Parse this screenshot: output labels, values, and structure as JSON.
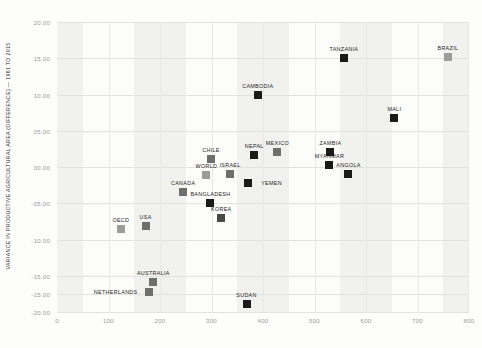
{
  "chart_data": {
    "type": "scatter",
    "title": "",
    "xlabel": "",
    "ylabel": "VARIANCE IN PRODUCTIVE AGRICULTURAL AREA (DIFFERENCE) — 1961 TO 2015",
    "xlim": [
      0,
      800
    ],
    "ylim": [
      -20,
      20
    ],
    "xticks": [
      "0",
      "100",
      "200",
      "300",
      "400",
      "500",
      "600",
      "700",
      "800"
    ],
    "xtick_values": [
      0,
      100,
      200,
      300,
      400,
      500,
      600,
      700,
      800
    ],
    "yticks": [
      "20.00",
      "15.00",
      "10.00",
      "05.00",
      "00.00",
      "-05.00",
      "-10.00",
      "-15.00",
      "-15.00",
      "-20.00"
    ],
    "ytick_values": [
      20,
      15,
      10,
      5,
      0,
      -5,
      -10,
      -15,
      -17.5,
      -20
    ],
    "grid": true,
    "legend": "none",
    "banding": "alternating vertical gray bands",
    "points": [
      {
        "label": "TANZANIA",
        "x": 557,
        "y": 15.0,
        "color": "#1a1a1a",
        "label_dx": 0,
        "label_dy": -9
      },
      {
        "label": "BRAZIL",
        "x": 759,
        "y": 15.2,
        "color": "#9c9c9a",
        "label_dx": 0,
        "label_dy": -9
      },
      {
        "label": "CAMBODIA",
        "x": 390,
        "y": 10.0,
        "color": "#1a1a1a",
        "label_dx": 0,
        "label_dy": -9
      },
      {
        "label": "MALI",
        "x": 655,
        "y": 6.7,
        "color": "#1a1a1a",
        "label_dx": 0,
        "label_dy": -9
      },
      {
        "label": "ZAMBIA",
        "x": 531,
        "y": 2.1,
        "color": "#1a1a1a",
        "label_dx": 0,
        "label_dy": -9
      },
      {
        "label": "MEXICO",
        "x": 428,
        "y": 2.1,
        "color": "#6e6e6c",
        "label_dx": 0,
        "label_dy": -9
      },
      {
        "label": "MYANMAR",
        "x": 529,
        "y": 0.3,
        "color": "#1a1a1a",
        "label_dx": 0,
        "label_dy": -9
      },
      {
        "label": "NEPAL",
        "x": 383,
        "y": 1.6,
        "color": "#1a1a1a",
        "label_dx": 0,
        "label_dy": -9
      },
      {
        "label": "CHILE",
        "x": 299,
        "y": 1.1,
        "color": "#6e6e6c",
        "label_dx": 0,
        "label_dy": -9
      },
      {
        "label": "ANGOLA",
        "x": 566,
        "y": -1.0,
        "color": "#1a1a1a",
        "label_dx": 0,
        "label_dy": -9
      },
      {
        "label": "ISRAEL",
        "x": 336,
        "y": -0.9,
        "color": "#6e6e6c",
        "label_dx": 0,
        "label_dy": -9
      },
      {
        "label": "WORLD",
        "x": 290,
        "y": -1.1,
        "color": "#9c9c9a",
        "label_dx": 0,
        "label_dy": -9
      },
      {
        "label": "YEMEN",
        "x": 370,
        "y": -2.2,
        "color": "#1a1a1a",
        "label_dx": 24,
        "label_dy": 0
      },
      {
        "label": "CANADA",
        "x": 245,
        "y": -3.5,
        "color": "#6e6e6c",
        "label_dx": 0,
        "label_dy": -9
      },
      {
        "label": "BANGLADESH",
        "x": 298,
        "y": -4.9,
        "color": "#1a1a1a",
        "label_dx": 0,
        "label_dy": -9
      },
      {
        "label": "KOREA",
        "x": 319,
        "y": -7.1,
        "color": "#4a4a48",
        "label_dx": 0,
        "label_dy": -9
      },
      {
        "label": "OECD",
        "x": 124,
        "y": -8.6,
        "color": "#9c9c9a",
        "label_dx": 0,
        "label_dy": -9
      },
      {
        "label": "USA",
        "x": 172,
        "y": -8.1,
        "color": "#6e6e6c",
        "label_dx": 0,
        "label_dy": -9
      },
      {
        "label": "AUSTRALIA",
        "x": 187,
        "y": -15.8,
        "color": "#6e6e6c",
        "label_dx": 0,
        "label_dy": -9
      },
      {
        "label": "NETHERLANDS",
        "x": 178,
        "y": -17.2,
        "color": "#6e6e6c",
        "label_dx": -33,
        "label_dy": 0
      },
      {
        "label": "SUDAN",
        "x": 368,
        "y": -18.9,
        "color": "#1a1a1a",
        "label_dx": 0,
        "label_dy": -9
      }
    ]
  }
}
